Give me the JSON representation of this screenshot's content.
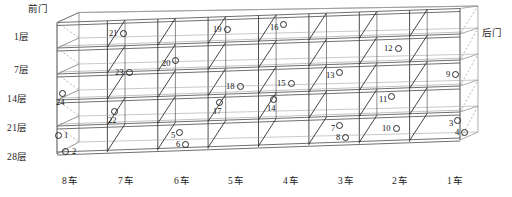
{
  "diagram": {
    "doors": {
      "front": "前门",
      "back": "后门"
    },
    "floor_labels": [
      "1层",
      "7层",
      "14层",
      "21层",
      "28层"
    ],
    "car_labels": [
      "8车",
      "7车",
      "6车",
      "5车",
      "4车",
      "3车",
      "2车",
      "1车"
    ],
    "colors": {
      "line": "#3a3a3a",
      "shelf": "#555555",
      "dashed": "#8a8a8a",
      "text": "#141414",
      "background": "#ffffff"
    },
    "grid": {
      "columns": 8,
      "rows": 4
    },
    "markers": [
      {
        "id": "21",
        "label": "21",
        "row": 1,
        "col": 8,
        "style": "nr"
      },
      {
        "id": "19",
        "label": "19",
        "row": 1,
        "col": 6,
        "style": "nr"
      },
      {
        "id": "16",
        "label": "16",
        "row": 1,
        "col": 5,
        "style": "rr"
      },
      {
        "id": "12",
        "label": "12",
        "row": 1,
        "col": 3,
        "style": "nr"
      },
      {
        "id": "23",
        "label": "23",
        "row": 2,
        "col": 8,
        "style": "nr"
      },
      {
        "id": "20",
        "label": "20",
        "row": 2,
        "col": 7,
        "style": "rr"
      },
      {
        "id": "18",
        "label": "18",
        "row": 2,
        "col": 6,
        "style": "nr"
      },
      {
        "id": "15",
        "label": "15",
        "row": 2,
        "col": 5,
        "style": "nr"
      },
      {
        "id": "13",
        "label": "13",
        "row": 2,
        "col": 4,
        "style": "rr"
      },
      {
        "id": "9",
        "label": "9",
        "row": 2,
        "col": 2,
        "style": "nr"
      },
      {
        "id": "24",
        "label": "24",
        "row": 3,
        "col": 8,
        "style": "stack"
      },
      {
        "id": "22",
        "label": "22",
        "row": 3,
        "col": 7,
        "style": "stack"
      },
      {
        "id": "17",
        "label": "17",
        "row": 3,
        "col": 6,
        "style": "stack"
      },
      {
        "id": "14",
        "label": "14",
        "row": 3,
        "col": 5,
        "style": "stack"
      },
      {
        "id": "11",
        "label": "11",
        "row": 3,
        "col": 3,
        "style": "rr"
      },
      {
        "id": "1",
        "label": "1",
        "row": 4,
        "col": 8,
        "style": "ring-left"
      },
      {
        "id": "2",
        "label": "2",
        "row": 4,
        "col": 8,
        "style": "ring-left"
      },
      {
        "id": "5",
        "label": "5",
        "row": 4,
        "col": 6,
        "style": "rr"
      },
      {
        "id": "6",
        "label": "6",
        "row": 4,
        "col": 6,
        "style": "nr"
      },
      {
        "id": "7",
        "label": "7",
        "row": 4,
        "col": 3,
        "style": "rr"
      },
      {
        "id": "8",
        "label": "8",
        "row": 4,
        "col": 3,
        "style": "nr"
      },
      {
        "id": "10",
        "label": "10",
        "row": 4,
        "col": 2,
        "style": "nr"
      },
      {
        "id": "3",
        "label": "3",
        "row": 4,
        "col": 1,
        "style": "rr"
      },
      {
        "id": "4",
        "label": "4",
        "row": 4,
        "col": 1,
        "style": "nr"
      }
    ]
  }
}
